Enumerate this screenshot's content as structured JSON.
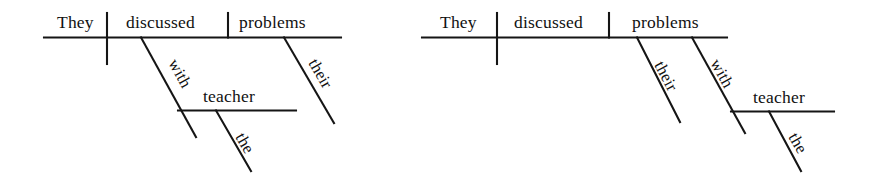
{
  "image": {
    "kind": "reed-kellogg-sentence-diagram-pair",
    "background_color": "#ffffff",
    "ink_color": "#151515"
  },
  "diagrams": [
    {
      "id": "left",
      "sentence": "They discussed problems with the teacher.",
      "reading": "prepositional phrase 'with the teacher' modifies the verb 'discussed'",
      "words": {
        "subject": "They",
        "verb": "discussed",
        "object": "problems",
        "preposition": "with",
        "prep_object": "teacher",
        "prep_object_article": "the",
        "object_modifier": "their"
      }
    },
    {
      "id": "right",
      "sentence": "They discussed their problems with the teacher.",
      "reading": "prepositional phrase 'with the teacher' modifies the noun 'problems'",
      "words": {
        "subject": "They",
        "verb": "discussed",
        "object": "problems",
        "preposition": "with",
        "prep_object": "teacher",
        "prep_object_article": "the",
        "object_modifier": "their"
      }
    }
  ],
  "labels": {
    "left_they": "They",
    "left_discussed": "discussed",
    "left_problems": "problems",
    "left_with": "with",
    "left_teacher": "teacher",
    "left_the": "the",
    "left_their": "their",
    "right_they": "They",
    "right_discussed": "discussed",
    "right_problems": "problems",
    "right_their": "their",
    "right_with": "with",
    "right_teacher": "teacher",
    "right_the": "the"
  }
}
